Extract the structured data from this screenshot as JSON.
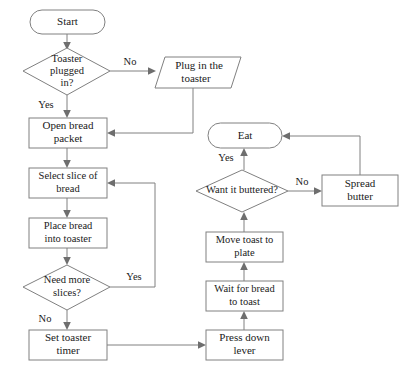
{
  "diagram": {
    "colors": {
      "stroke": "#808080",
      "fill": "#ffffff",
      "text": "#1a1a1a",
      "arrow": "#6e6e6e"
    },
    "nodes": [
      {
        "id": "start",
        "shape": "terminator",
        "label_lines": [
          "Start"
        ]
      },
      {
        "id": "plugged",
        "shape": "decision",
        "label_lines": [
          "Toaster",
          "plugged",
          "in?"
        ]
      },
      {
        "id": "plug",
        "shape": "parallelogram",
        "label_lines": [
          "Plug in the",
          "toaster"
        ]
      },
      {
        "id": "open",
        "shape": "process",
        "label_lines": [
          "Open bread",
          "packet"
        ]
      },
      {
        "id": "select",
        "shape": "process",
        "label_lines": [
          "Select slice of",
          "bread"
        ]
      },
      {
        "id": "place",
        "shape": "process",
        "label_lines": [
          "Place bread",
          "into toaster"
        ]
      },
      {
        "id": "needmore",
        "shape": "decision",
        "label_lines": [
          "Need more",
          "slices?"
        ]
      },
      {
        "id": "settimer",
        "shape": "process",
        "label_lines": [
          "Set toaster",
          "timer"
        ]
      },
      {
        "id": "presslever",
        "shape": "process",
        "label_lines": [
          "Press down",
          "lever"
        ]
      },
      {
        "id": "waittoast",
        "shape": "process",
        "label_lines": [
          "Wait for bread",
          "to toast"
        ]
      },
      {
        "id": "movetoast",
        "shape": "process",
        "label_lines": [
          "Move toast to",
          "plate"
        ]
      },
      {
        "id": "buttered",
        "shape": "decision",
        "label_lines": [
          "Want it buttered?"
        ]
      },
      {
        "id": "spread",
        "shape": "process",
        "label_lines": [
          "Spread",
          "butter"
        ]
      },
      {
        "id": "eat",
        "shape": "terminator",
        "label_lines": [
          "Eat"
        ]
      }
    ],
    "edge_labels": {
      "plugged_no": "No",
      "plugged_yes": "Yes",
      "needmore_yes": "Yes",
      "needmore_no": "No",
      "buttered_no": "No",
      "buttered_yes": "Yes"
    }
  }
}
